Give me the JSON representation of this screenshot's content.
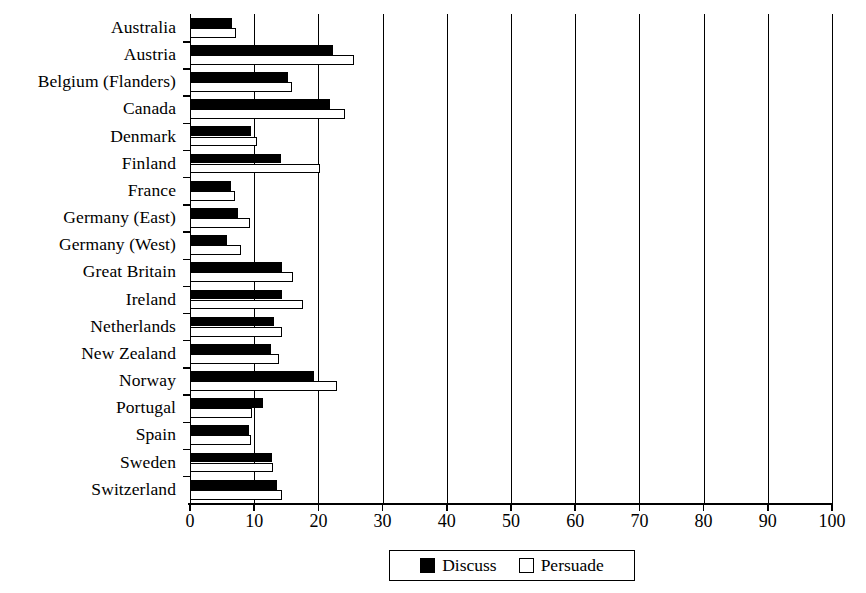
{
  "chart_data": {
    "type": "bar",
    "orientation": "horizontal",
    "title": "",
    "xlabel": "",
    "ylabel": "",
    "xlim": [
      0,
      100
    ],
    "xticks": [
      0,
      10,
      20,
      30,
      40,
      50,
      60,
      70,
      80,
      90,
      100
    ],
    "grid": true,
    "grid_axis": "x",
    "legend_position": "bottom-center",
    "categories": [
      "Australia",
      "Austria",
      "Belgium (Flanders)",
      "Canada",
      "Denmark",
      "Finland",
      "France",
      "Germany (East)",
      "Germany (West)",
      "Great Britain",
      "Ireland",
      "Netherlands",
      "New Zealand",
      "Norway",
      "Portugal",
      "Spain",
      "Sweden",
      "Switzerland"
    ],
    "series": [
      {
        "name": "Discuss",
        "color": "#000000",
        "values": [
          6.5,
          22.3,
          15.3,
          21.8,
          9.5,
          14.2,
          6.4,
          7.5,
          5.8,
          14.3,
          14.3,
          13.1,
          12.6,
          19.3,
          11.4,
          9.2,
          12.8,
          13.6
        ]
      },
      {
        "name": "Persuade",
        "color": "#ffffff",
        "values": [
          7.2,
          25.5,
          15.9,
          24.1,
          10.4,
          20.2,
          7.0,
          9.3,
          8.0,
          16.0,
          17.6,
          14.3,
          13.9,
          22.9,
          9.7,
          9.5,
          12.9,
          14.3
        ]
      }
    ]
  },
  "legend": {
    "items": [
      {
        "label": "Discuss",
        "swatch": "filled-black"
      },
      {
        "label": "Persuade",
        "swatch": "outline-white"
      }
    ]
  }
}
